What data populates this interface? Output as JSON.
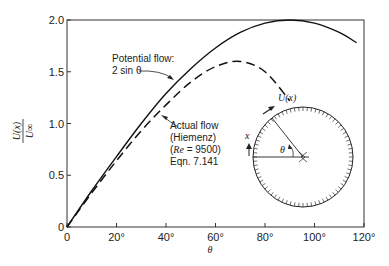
{
  "chart_data": {
    "type": "line",
    "title": "",
    "xlabel": "θ",
    "ylabel_num": "U(x)",
    "ylabel_den": "U∞",
    "xlim": [
      0,
      120
    ],
    "ylim": [
      0,
      2.0
    ],
    "grid": false,
    "x_ticks": [
      0,
      20,
      40,
      60,
      80,
      100,
      120
    ],
    "x_tick_labels": [
      "0",
      "20°",
      "40°",
      "60°",
      "80°",
      "100°",
      "120°"
    ],
    "y_ticks": [
      0,
      0.5,
      1.0,
      1.5,
      2.0
    ],
    "y_tick_labels": [
      "0",
      "0.5",
      "1.0",
      "1.5",
      "2.0"
    ],
    "series": [
      {
        "name": "Potential flow: 2 sin θ",
        "style": "solid",
        "x": [
          0,
          10,
          20,
          30,
          40,
          50,
          60,
          70,
          80,
          90,
          100,
          110,
          117
        ],
        "values": [
          0,
          0.35,
          0.68,
          1.0,
          1.29,
          1.53,
          1.73,
          1.88,
          1.97,
          2.0,
          1.97,
          1.88,
          1.78
        ]
      },
      {
        "name": "Actual flow (Hiemenz) (Re = 9500) Eqn. 7.141",
        "style": "dashed",
        "x": [
          0,
          10,
          20,
          30,
          40,
          50,
          60,
          70,
          80,
          90
        ],
        "values": [
          0,
          0.33,
          0.64,
          0.93,
          1.18,
          1.4,
          1.55,
          1.6,
          1.5,
          1.22
        ]
      }
    ],
    "annotations": [
      {
        "text_lines": [
          "Potential flow:",
          "2 sin θ"
        ],
        "points_to": "solid curve"
      },
      {
        "text_lines": [
          "Actual flow",
          "(Hiemenz)",
          "(Re = 9500)",
          "Eqn. 7.141"
        ],
        "points_to": "dashed curve"
      }
    ],
    "inset": {
      "description": "cylinder cross-section with surface coordinate",
      "labels": {
        "velocity": "U(x)",
        "coordinate": "x",
        "angle": "θ"
      }
    }
  },
  "labels": {
    "potential_line1": "Potential flow:",
    "potential_line2": "2 sin θ",
    "actual_line1": "Actual flow",
    "actual_line2": "(Hiemenz)",
    "actual_line3_re": "Re",
    "actual_line3_rest": " = 9500)",
    "actual_line4": "Eqn. 7.141",
    "inset_velocity": "U(x)",
    "inset_x": "x",
    "inset_theta": "θ",
    "xlabel": "θ",
    "ylabel_num": "U(x)",
    "ylabel_den": "U∞"
  }
}
